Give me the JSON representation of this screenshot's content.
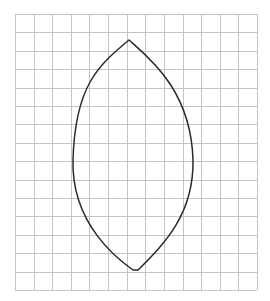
{
  "diagram": {
    "type": "grid-with-curve",
    "background": "#ffffff",
    "grid": {
      "x0": 15,
      "y0": 14,
      "x1": 257,
      "y1": 290,
      "columns": 13,
      "rows": 15,
      "line_color": "#c4c4c4",
      "line_width": 1
    },
    "shape": {
      "name": "leaf-shape-outline",
      "stroke": "#2a2a2a",
      "stroke_width": 1.5,
      "top_point": [
        129,
        40
      ],
      "bottom_flat": [
        [
          133,
          270
        ],
        [
          138,
          270
        ]
      ],
      "widest_left_x": 73,
      "widest_right_x": 193,
      "widest_y": 160
    }
  }
}
